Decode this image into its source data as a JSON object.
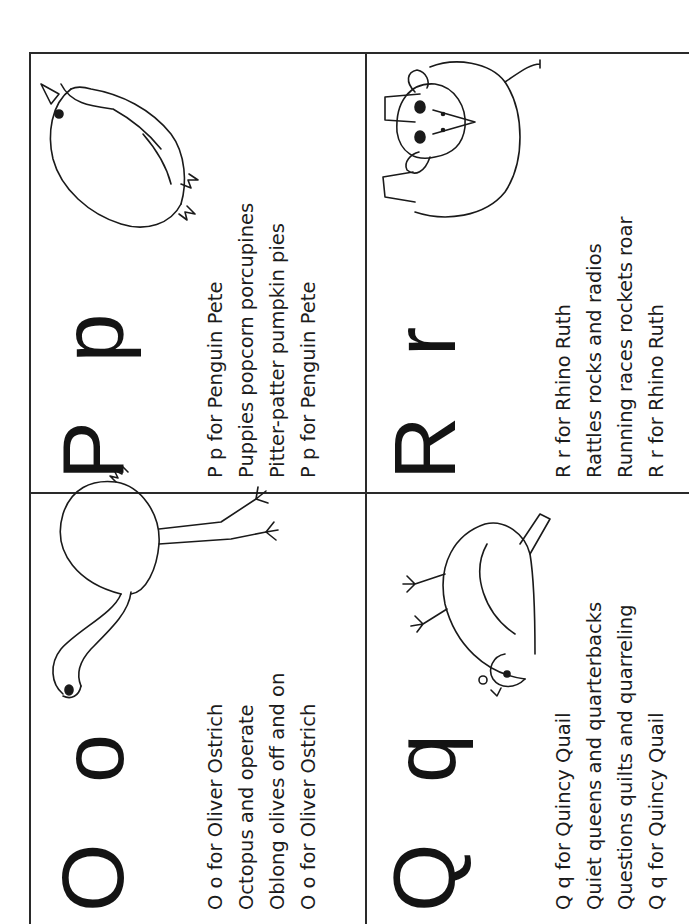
{
  "worksheet": {
    "cells": [
      {
        "id": "o",
        "big_letters": "O o",
        "animal": "ostrich",
        "lines": [
          "O o for Oliver Ostrich",
          "Octopus and operate",
          "Oblong olives off and on",
          "O o for Oliver Ostrich"
        ]
      },
      {
        "id": "p",
        "big_letters": "P p",
        "animal": "penguin",
        "lines": [
          "P p for Penguin Pete",
          "Puppies popcorn porcupines",
          "Pitter-patter pumpkin pies",
          "P p for Penguin Pete"
        ]
      },
      {
        "id": "q",
        "big_letters": "Q q",
        "animal": "quail",
        "lines": [
          "Q q for Quincy Quail",
          "Quiet queens and quarterbacks",
          "Questions quilts and quarreling",
          "Q q for Quincy Quail"
        ]
      },
      {
        "id": "r",
        "big_letters": "R r",
        "animal": "rhino",
        "lines": [
          "R r for Rhino Ruth",
          "Rattles rocks and radios",
          "Running races rockets roar",
          "R r for Rhino Ruth"
        ]
      }
    ],
    "orientation": "rotated-90-ccw",
    "line_color": "#2a2a2a",
    "text_color": "#1a1a1a"
  }
}
